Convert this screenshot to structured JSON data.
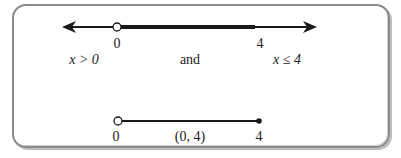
{
  "diagram": {
    "top_line": {
      "tick_left_label": "0",
      "tick_right_label": "4",
      "left_endpoint": "open",
      "right_endpoint": "none",
      "arrows": "both"
    },
    "conditions": {
      "left": "x > 0",
      "connector": "and",
      "right": "x ≤ 4"
    },
    "bottom_line": {
      "tick_left_label": "0",
      "interval_label": "(0, 4)",
      "tick_right_label": "4",
      "left_endpoint": "open",
      "right_endpoint": "closed"
    },
    "colors": {
      "line": "#1a1a1a",
      "frame": "#8a8a8a",
      "text": "#222222"
    }
  }
}
